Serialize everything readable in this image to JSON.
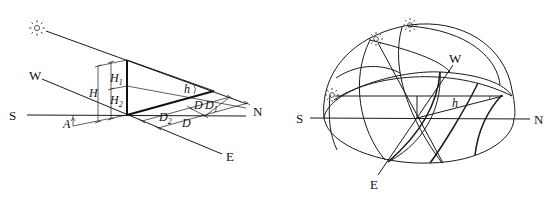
{
  "left_figure": {
    "compass": {
      "south": "S",
      "north": "N",
      "west": "W",
      "east": "E"
    },
    "labels": {
      "H": "H",
      "H1": "H",
      "H1_sub": "1",
      "H2": "H",
      "H2_sub": "2",
      "h": "h",
      "A": "A",
      "D_top": "D",
      "D1": "D",
      "D1_sub": "1",
      "D2": "D",
      "D2_sub": "2",
      "D_bottom": "D"
    },
    "icons": [
      "sun-icon"
    ]
  },
  "right_figure": {
    "compass": {
      "south": "S",
      "north": "N",
      "west": "W",
      "east": "E"
    },
    "labels": {
      "h": "h"
    },
    "icons": [
      "sun-icon",
      "sun-icon",
      "sun-icon"
    ]
  }
}
